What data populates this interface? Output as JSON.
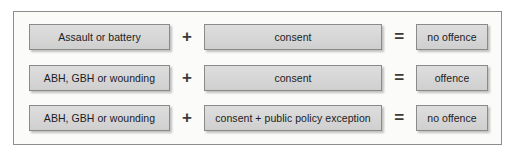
{
  "diagram": {
    "type": "equation-rows",
    "colors": {
      "frame_border": "#8d8d8d",
      "frame_background": "#fbfbf9",
      "box_fill": "#d8d8d8",
      "box_border": "#8a8a8a",
      "text": "#1c1c1c",
      "operator": "#3a3a3a"
    },
    "operators": {
      "plus": "+",
      "equals": "="
    },
    "rows": [
      {
        "subject": "Assault or battery",
        "operator_1": "+",
        "condition": "consent",
        "operator_2": "=",
        "result": "no offence"
      },
      {
        "subject": "ABH, GBH or wounding",
        "operator_1": "+",
        "condition": "consent",
        "operator_2": "=",
        "result": "offence"
      },
      {
        "subject": "ABH, GBH or wounding",
        "operator_1": "+",
        "condition": "consent + public policy exception",
        "operator_2": "=",
        "result": "no offence"
      }
    ]
  }
}
